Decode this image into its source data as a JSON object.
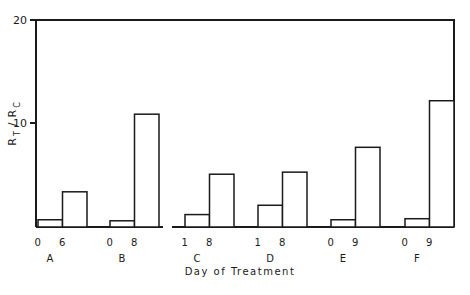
{
  "chart_data": {
    "type": "bar",
    "title": "",
    "xlabel": "Day of Treatment",
    "ylabel": "R_T / R_C",
    "ylabel_parts": {
      "r1": "R",
      "s1": "T",
      "slash": "/",
      "r2": "R",
      "s2": "C"
    },
    "ylim": [
      0,
      20
    ],
    "yticks": [
      10,
      20
    ],
    "grid": false,
    "legend": null,
    "groups": [
      {
        "group": "A",
        "days": [
          "0",
          "6"
        ],
        "values": [
          0.7,
          3.4
        ]
      },
      {
        "group": "B",
        "days": [
          "0",
          "8"
        ],
        "values": [
          0.6,
          10.9
        ]
      },
      {
        "group": "C",
        "days": [
          "1",
          "8"
        ],
        "values": [
          1.2,
          5.1
        ]
      },
      {
        "group": "D",
        "days": [
          "1",
          "8"
        ],
        "values": [
          2.1,
          5.3
        ]
      },
      {
        "group": "E",
        "days": [
          "0",
          "9"
        ],
        "values": [
          0.7,
          7.7
        ]
      },
      {
        "group": "F",
        "days": [
          "0",
          "9"
        ],
        "values": [
          0.8,
          12.2
        ]
      }
    ],
    "categories": [
      "A-0",
      "A-6",
      "B-0",
      "B-8",
      "C-1",
      "C-8",
      "D-1",
      "D-8",
      "E-0",
      "E-9",
      "F-0",
      "F-9"
    ],
    "values": [
      0.7,
      3.4,
      0.6,
      10.9,
      1.2,
      5.1,
      2.1,
      5.3,
      0.7,
      7.7,
      0.8,
      12.2
    ]
  }
}
